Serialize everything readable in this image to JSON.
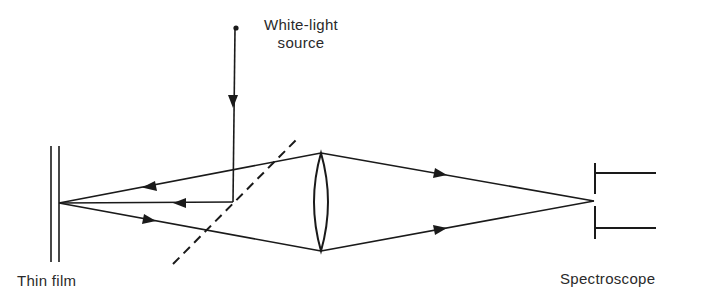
{
  "diagram": {
    "labels": {
      "source_line1": "White-light",
      "source_line2": "source",
      "thin_film": "Thin film",
      "spectroscope": "Spectroscope"
    },
    "components": [
      {
        "name": "white-light-source",
        "type": "point-source"
      },
      {
        "name": "beam-splitter",
        "type": "dashed-half-silvered-mirror"
      },
      {
        "name": "thin-film",
        "type": "double-line-film"
      },
      {
        "name": "lens",
        "type": "biconvex-lens"
      },
      {
        "name": "spectroscope",
        "type": "slit-entrance"
      }
    ],
    "rays": [
      {
        "from": "source",
        "to": "beam-splitter",
        "direction": "down"
      },
      {
        "from": "beam-splitter",
        "to": "thin-film",
        "direction": "left"
      },
      {
        "from": "lens",
        "to": "thin-film",
        "direction": "left",
        "path": "upper"
      },
      {
        "from": "thin-film",
        "to": "lens",
        "direction": "right",
        "path": "lower"
      },
      {
        "from": "lens",
        "to": "spectroscope",
        "direction": "right",
        "path": "upper"
      },
      {
        "from": "lens",
        "to": "spectroscope",
        "direction": "right",
        "path": "lower"
      }
    ],
    "colors": {
      "ink": "#1a1a1a",
      "background": "#ffffff"
    }
  }
}
